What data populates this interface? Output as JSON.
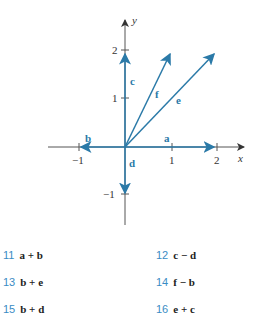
{
  "figure": {
    "axes": {
      "x_label": "x",
      "y_label": "y",
      "x_ticks": [
        {
          "value": -1,
          "label": "−1"
        },
        {
          "value": 1,
          "label": "1"
        },
        {
          "value": 2,
          "label": "2"
        }
      ],
      "y_ticks": [
        {
          "value": -1,
          "label": "−1"
        },
        {
          "value": 1,
          "label": "1"
        },
        {
          "value": 2,
          "label": "2"
        }
      ]
    },
    "vectors": [
      {
        "name": "a",
        "to": [
          2,
          0
        ]
      },
      {
        "name": "b",
        "to": [
          -1,
          0
        ]
      },
      {
        "name": "c",
        "to": [
          0,
          2
        ]
      },
      {
        "name": "d",
        "to": [
          0,
          -1
        ]
      },
      {
        "name": "e",
        "to": [
          2,
          2
        ]
      },
      {
        "name": "f",
        "to": [
          1,
          2
        ]
      }
    ],
    "colors": {
      "vector": "#2b7aa8",
      "axis": "#555555"
    }
  },
  "exercises": [
    {
      "num": "11",
      "expr": "a + b"
    },
    {
      "num": "12",
      "expr": "c − d"
    },
    {
      "num": "13",
      "expr": "b + e"
    },
    {
      "num": "14",
      "expr": "f − b"
    },
    {
      "num": "15",
      "expr": "b + d"
    },
    {
      "num": "16",
      "expr": "e + c"
    }
  ]
}
